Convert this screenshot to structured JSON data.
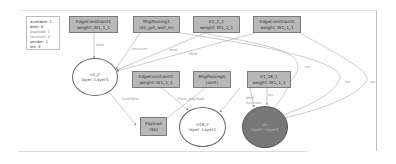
{
  "legend": {
    "lines": [
      "available: 1",
      "dest: 8",
      "payload: 1",
      "receiver: 2",
      "sender: 1",
      "src: 3"
    ]
  },
  "nodes": {
    "edge_constraint1": {
      "line1": "EdgeConstraint1",
      "line2": "weight: W1_1_1"
    },
    "msg_passing1": {
      "line1": "MsgPassing1",
      "line2": "($E_get_wait_m)"
    },
    "e1_1_1": {
      "line1": "E1_1_1",
      "line2": "weight: W1_1_1"
    },
    "edge_constraint_top4": {
      "line1": "EdgeConstraint1",
      "line2": "weight: W1_1_1"
    },
    "n1_2": {
      "line1": "n1_2",
      "line2": "layer: Layer1"
    },
    "edge_constraint2": {
      "line1": "EdgeConstraint2",
      "line2": "weight: W1_1_1"
    },
    "msg_passing0": {
      "line1": "MsgPassing0",
      "line2": "(sent)"
    },
    "e1_18_1": {
      "line1": "E1_18_1",
      "line2": "weight: W1_1_1"
    },
    "payload": {
      "line1": "Payload",
      "line2": "($b)"
    },
    "n18_2": {
      "line1": "n18_2",
      "line2": "layer: Layer1"
    },
    "dn": {
      "line1": "dn",
      "line2": "layer: Layer1"
    }
  },
  "edge_labels": {
    "dest1": "dest",
    "receiver": "receiver",
    "dest2": "dest",
    "dest3": "dest",
    "available": "available",
    "from_payload": "from_payload",
    "dest4": "dest",
    "function": "function",
    "src1": "src",
    "src2": "src",
    "src3": "src",
    "src4": "src"
  },
  "colors": {
    "box_fill": "#b8b8b8",
    "dark_node": "#777777",
    "edge": "#aaaaaa"
  }
}
